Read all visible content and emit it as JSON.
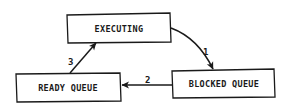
{
  "diagram": {
    "type": "state-transition",
    "colors": {
      "stroke": "#1a1a1a",
      "background": "#ffffff",
      "text": "#1a1a1a"
    },
    "nodes": [
      {
        "id": "executing",
        "label": "EXECUTING"
      },
      {
        "id": "ready",
        "label": "READY QUEUE"
      },
      {
        "id": "blocked",
        "label": "BLOCKED QUEUE"
      }
    ],
    "edges": [
      {
        "id": "e1",
        "from": "executing",
        "to": "blocked",
        "label": "1"
      },
      {
        "id": "e2",
        "from": "blocked",
        "to": "ready",
        "label": "2"
      },
      {
        "id": "e3",
        "from": "ready",
        "to": "executing",
        "label": "3"
      }
    ]
  }
}
